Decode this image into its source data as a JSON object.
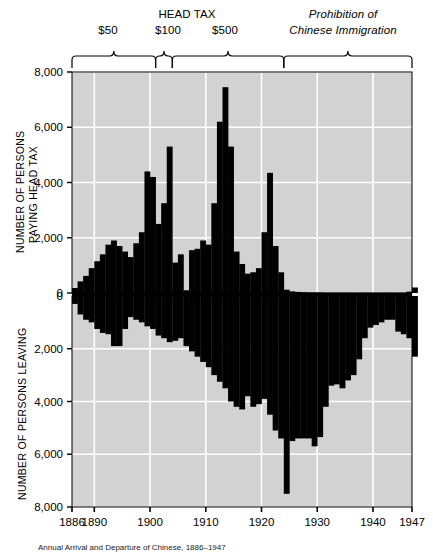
{
  "figure": {
    "caption": "Annual Arrival and Departure of Chinese, 1886–1947",
    "bg_color": "#d2d2d2",
    "bar_color": "#000000",
    "grid_color": "#ffffff"
  },
  "header": {
    "head_tax_title": "HEAD TAX",
    "prohibition_line1": "Prohibition of",
    "prohibition_line2": "Chinese Immigration",
    "periods": [
      {
        "label": "$50",
        "start_year": 1886,
        "end_year": 1901
      },
      {
        "label": "$100",
        "start_year": 1901,
        "end_year": 1904
      },
      {
        "label": "$500",
        "start_year": 1904,
        "end_year": 1924
      },
      {
        "label": "Prohibition of Chinese Immigration",
        "start_year": 1924,
        "end_year": 1947
      }
    ]
  },
  "chart_data": {
    "type": "bar",
    "title": "Annual Arrival and Departure of Chinese, 1886–1947",
    "xlabel": "",
    "xlim": [
      1886,
      1947
    ],
    "xticks": [
      1886,
      1890,
      1900,
      1910,
      1920,
      1930,
      1940,
      1947
    ],
    "xticklabels": [
      "1886",
      "1890",
      "1900",
      "1910",
      "1920",
      "1930",
      "1940",
      "1947"
    ],
    "grid": true,
    "legend": "none",
    "panels": [
      {
        "name": "arrival",
        "series_label": "Annual Arrival",
        "ylabel": "NUMBER OF PERSONS PAYING HEAD TAX",
        "ylabel_line1": "NUMBER OF PERSONS",
        "ylabel_line2": "PAYING HEAD TAX",
        "ylim": [
          0,
          8000
        ],
        "yticks": [
          0,
          2000,
          4000,
          6000,
          8000
        ],
        "yticklabels": [
          "0",
          "2,000",
          "4,000",
          "6,000",
          "8,000"
        ],
        "direction": "up",
        "x": [
          1886,
          1887,
          1888,
          1889,
          1890,
          1891,
          1892,
          1893,
          1894,
          1895,
          1896,
          1897,
          1898,
          1899,
          1900,
          1901,
          1902,
          1903,
          1904,
          1905,
          1906,
          1907,
          1908,
          1909,
          1910,
          1911,
          1912,
          1913,
          1914,
          1915,
          1916,
          1917,
          1918,
          1919,
          1920,
          1921,
          1922,
          1923,
          1924,
          1925,
          1926,
          1927,
          1928,
          1929,
          1930,
          1931,
          1932,
          1933,
          1934,
          1935,
          1936,
          1937,
          1938,
          1939,
          1940,
          1941,
          1942,
          1943,
          1944,
          1945,
          1946,
          1947
        ],
        "values": [
          180,
          420,
          620,
          900,
          1150,
          1400,
          1750,
          1900,
          1700,
          1500,
          1300,
          1800,
          2200,
          4400,
          4200,
          2500,
          3250,
          5300,
          1100,
          1400,
          100,
          1550,
          1600,
          1900,
          1750,
          3250,
          6200,
          7450,
          5300,
          1500,
          1050,
          700,
          750,
          900,
          2200,
          4350,
          1700,
          750,
          120,
          60,
          40,
          30,
          20,
          20,
          20,
          10,
          10,
          10,
          10,
          10,
          10,
          10,
          10,
          10,
          10,
          10,
          10,
          10,
          10,
          10,
          50,
          200
        ]
      },
      {
        "name": "departure",
        "series_label": "Annual Departure",
        "ylabel": "NUMBER OF PERSONS LEAVING",
        "ylim": [
          0,
          8000
        ],
        "yticks": [
          0,
          2000,
          4000,
          6000,
          8000
        ],
        "yticklabels": [
          "0",
          "2,000",
          "4,000",
          "6,000",
          "8,000"
        ],
        "direction": "down",
        "x": [
          1886,
          1887,
          1888,
          1889,
          1890,
          1891,
          1892,
          1893,
          1894,
          1895,
          1896,
          1897,
          1898,
          1899,
          1900,
          1901,
          1902,
          1903,
          1904,
          1905,
          1906,
          1907,
          1908,
          1909,
          1910,
          1911,
          1912,
          1913,
          1914,
          1915,
          1916,
          1917,
          1918,
          1919,
          1920,
          1921,
          1922,
          1923,
          1924,
          1925,
          1926,
          1927,
          1928,
          1929,
          1930,
          1931,
          1932,
          1933,
          1934,
          1935,
          1936,
          1937,
          1938,
          1939,
          1940,
          1941,
          1942,
          1943,
          1944,
          1945,
          1946,
          1947
        ],
        "values": [
          300,
          700,
          900,
          1000,
          1250,
          1400,
          1450,
          1900,
          1900,
          1250,
          800,
          900,
          1000,
          1150,
          1250,
          1500,
          1600,
          1750,
          1700,
          1600,
          1900,
          2100,
          2300,
          2500,
          2700,
          3000,
          3250,
          3500,
          4000,
          4200,
          4300,
          3800,
          4200,
          4100,
          3900,
          4500,
          5100,
          5400,
          7500,
          5500,
          5400,
          5400,
          5400,
          5700,
          5350,
          4200,
          3400,
          3350,
          3500,
          3200,
          3000,
          2400,
          1600,
          1200,
          1100,
          1000,
          900,
          900,
          1350,
          1450,
          1600,
          2300
        ]
      }
    ]
  },
  "axes": {
    "arrival_ylabel_l1": "NUMBER OF PERSONS",
    "arrival_ylabel_l2": "PAYING HEAD TAX",
    "departure_ylabel": "NUMBER OF PERSONS LEAVING"
  }
}
